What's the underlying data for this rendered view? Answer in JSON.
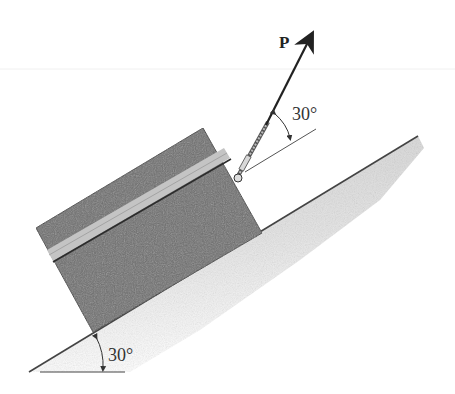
{
  "figure": {
    "force_label": "P",
    "cable_angle_label": "30°",
    "incline_angle_label": "30°"
  },
  "colors": {
    "crate": "#6e6e6e",
    "crate_band": "#c4c4c4",
    "ground_fill": "#dcdcdc",
    "lines": "#333333"
  }
}
